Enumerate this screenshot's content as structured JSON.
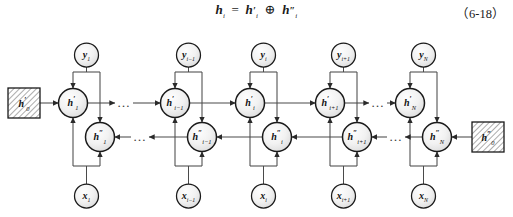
{
  "figure": {
    "title_equation": "h_i = h'_i ⊕ h''_i",
    "equation_display": "h",
    "equation_number": "（6-18）",
    "type": "bidirectional-rnn-unfolded-diagram",
    "colors": {
      "stroke": "#1a1a1a",
      "link": "#4a4a4a",
      "node_fill_light": "#fbfbfb",
      "node_fill_shade": "#e3e3e3",
      "hatch": "#555555",
      "background": "#ffffff"
    }
  },
  "equation": {
    "lhs_base": "h",
    "lhs_sub": "i",
    "eq_sign": "=",
    "term1_base": "h",
    "term1_prime": "′",
    "term1_sub": "i",
    "operator": "⊕",
    "term2_base": "h",
    "term2_prime": "″",
    "term2_sub": "i",
    "number": "（6-18）"
  },
  "init_states": [
    {
      "id": "h0-forward",
      "base": "h",
      "prime": "′",
      "sub": "0",
      "shape": "hatched-square",
      "x": 24,
      "y": 103
    },
    {
      "id": "h0-backward",
      "base": "h",
      "prime": "″",
      "sub": "0",
      "shape": "hatched-square",
      "x": 488,
      "y": 137
    }
  ],
  "columns": [
    {
      "index": "1",
      "x_forward": 73,
      "x_backward": 100,
      "y_node": {
        "base": "y",
        "sub": "1"
      },
      "x_node": {
        "base": "x",
        "sub": "1"
      },
      "h_forward": {
        "base": "h",
        "prime": "′",
        "sub": "1"
      },
      "h_backward": {
        "base": "h",
        "prime": "″",
        "sub": "1"
      }
    },
    {
      "index": "i-1",
      "x_forward": 175,
      "x_backward": 202,
      "y_node": {
        "base": "y",
        "sub": "i−1"
      },
      "x_node": {
        "base": "x",
        "sub": "i−1"
      },
      "h_forward": {
        "base": "h",
        "prime": "′",
        "sub": "i−1"
      },
      "h_backward": {
        "base": "h",
        "prime": "″",
        "sub": "i−1"
      }
    },
    {
      "index": "i",
      "x_forward": 250,
      "x_backward": 277,
      "y_node": {
        "base": "y",
        "sub": "i"
      },
      "x_node": {
        "base": "x",
        "sub": "i"
      },
      "h_forward": {
        "base": "h",
        "prime": "′",
        "sub": "i"
      },
      "h_backward": {
        "base": "h",
        "prime": "″",
        "sub": "i"
      }
    },
    {
      "index": "i+1",
      "x_forward": 330,
      "x_backward": 357,
      "y_node": {
        "base": "y",
        "sub": "i+1"
      },
      "x_node": {
        "base": "x",
        "sub": "i+1"
      },
      "h_forward": {
        "base": "h",
        "prime": "′",
        "sub": "i+1"
      },
      "h_backward": {
        "base": "h",
        "prime": "″",
        "sub": "i+1"
      }
    },
    {
      "index": "N",
      "x_forward": 410,
      "x_backward": 437,
      "y_node": {
        "base": "y",
        "sub": "N"
      },
      "x_node": {
        "base": "x",
        "sub": "N"
      },
      "h_forward": {
        "base": "h",
        "prime": "′",
        "sub": "N"
      },
      "h_backward": {
        "base": "h",
        "prime": "″",
        "sub": "N"
      }
    }
  ],
  "ellipses": [
    {
      "id": "forward-gap-1",
      "glyph": "…",
      "x": 124,
      "y": 103,
      "row": "forward"
    },
    {
      "id": "backward-gap-1",
      "glyph": "…",
      "x": 140,
      "y": 137,
      "row": "backward"
    },
    {
      "id": "forward-gap-2",
      "glyph": "…",
      "x": 378,
      "y": 103,
      "row": "forward"
    },
    {
      "id": "backward-gap-2",
      "glyph": "…",
      "x": 396,
      "y": 137,
      "row": "backward"
    }
  ],
  "rows": {
    "y_row_cy": 55,
    "y_bar_cy": 72,
    "forward_cy": 103,
    "backward_cy": 137,
    "x_bar_cy": 166,
    "x_row_cy": 196,
    "node_radius": 14.5,
    "small_radius": 12
  }
}
